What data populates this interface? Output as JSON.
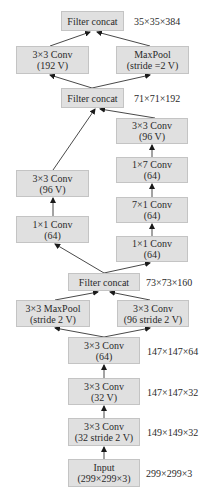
{
  "nodes": {
    "concat_top": {
      "line1": "Filter concat",
      "line2": ""
    },
    "conv3x3_192v": {
      "line1": "3×3 Conv",
      "line2": "(192 V)"
    },
    "maxpool_stride2v": {
      "line1": "MaxPool",
      "line2": "(stride =2 V)"
    },
    "concat_mid": {
      "line1": "Filter concat",
      "line2": ""
    },
    "right_conv3x3_96v": {
      "line1": "3×3 Conv",
      "line2": "(96 V)"
    },
    "right_conv1x7": {
      "line1": "1×7 Conv",
      "line2": "(64)"
    },
    "right_conv7x1": {
      "line1": "7×1 Conv",
      "line2": "(64)"
    },
    "right_conv1x1": {
      "line1": "1×1 Conv",
      "line2": "(64)"
    },
    "left_conv3x3_96v": {
      "line1": "3×3 Conv",
      "line2": "(96 V)"
    },
    "left_conv1x1": {
      "line1": "1×1 Conv",
      "line2": "(64)"
    },
    "concat_low": {
      "line1": "Filter concat",
      "line2": ""
    },
    "maxpool3x3_stride2v": {
      "line1": "3×3 MaxPool",
      "line2": "(stride 2 V)"
    },
    "conv3x3_96_stride2v": {
      "line1": "3×3 Conv",
      "line2": "(96 stride 2 V)"
    },
    "conv3x3_64": {
      "line1": "3×3 Conv",
      "line2": "(64)"
    },
    "conv3x3_32v": {
      "line1": "3×3 Conv",
      "line2": "(32 V)"
    },
    "conv3x3_32_stride2v": {
      "line1": "3×3 Conv",
      "line2": "(32 stride 2 V)"
    },
    "input": {
      "line1": "Input",
      "line2": "(299×299×3)"
    }
  },
  "dimensions": {
    "concat_top": "35×35×384",
    "concat_mid": "71×71×192",
    "concat_low": "73×73×160",
    "conv3x3_64": "147×147×64",
    "conv3x3_32v": "147×147×32",
    "conv3x3_32_stride2v": "149×149×32",
    "input": "299×299×3"
  },
  "colors": {
    "box_fill": "#e0e0e0",
    "box_border": "#c4c4c4",
    "edge": "#1a1a1a"
  }
}
